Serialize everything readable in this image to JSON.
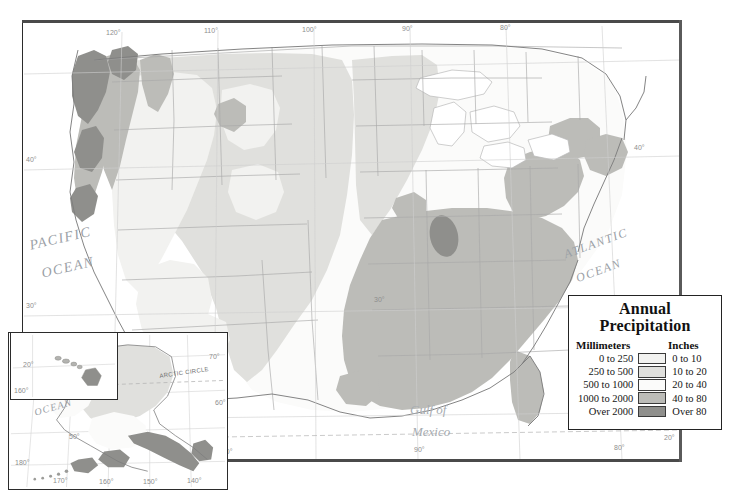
{
  "map": {
    "title": "Annual Precipitation",
    "title_line1": "Annual",
    "title_line2": "Precipitation",
    "ocean_labels": {
      "pacific_line1": "PACIFIC",
      "pacific_line2": "OCEAN",
      "atlantic_line1": "ATLANTIC",
      "atlantic_line2": "OCEAN",
      "gulf_line1": "Gulf of",
      "gulf_line2": "Mexico",
      "inset_pacific_line1": "PACIFIC",
      "inset_pacific_line2": "OCEAN"
    },
    "reference_lines": {
      "tropic_of_cancer": "TROPIC OF CANCER",
      "arctic_circle": "ARCTIC CIRCLE"
    },
    "graticule_top": [
      "120°",
      "110°",
      "100°",
      "90°",
      "80°"
    ],
    "graticule_bottom": [
      "100°",
      "90°",
      "80°",
      "20°"
    ],
    "graticule_left": [
      "40°",
      "30°"
    ],
    "graticule_right": [
      "40°",
      "30°"
    ],
    "alaska_inset": {
      "graticule_bottom": [
        "180°",
        "170°",
        "160°",
        "150°",
        "140°"
      ],
      "graticule_right": [
        "70°",
        "60°",
        "50°"
      ]
    },
    "hawaii_inset": {
      "graticule_left": [
        "20°"
      ],
      "graticule_bottom": [
        "160°"
      ]
    }
  },
  "legend": {
    "title_line1": "Annual",
    "title_line2": "Precipitation",
    "header_millimeters": "Millimeters",
    "header_inches": "Inches",
    "classes": [
      {
        "millimeters": "0 to 250",
        "inches": "0 to 10",
        "color": "#f2f2f0"
      },
      {
        "millimeters": "250 to 500",
        "inches": "10 to 20",
        "color": "#e0e0dd"
      },
      {
        "millimeters": "500 to 1000",
        "inches": "20 to 40",
        "color": "#fbfbfa"
      },
      {
        "millimeters": "1000 to 2000",
        "inches": "40 to 80",
        "color": "#bcbcb8"
      },
      {
        "millimeters": "Over 2000",
        "inches": "Over 80",
        "color": "#8f8f8c"
      }
    ]
  },
  "chart_data": {
    "type": "map",
    "title": "Annual Precipitation",
    "classes": [
      {
        "label_mm": "0 to 250",
        "label_in": "0 to 10",
        "min_mm": 0,
        "max_mm": 250,
        "color": "#f2f2f0"
      },
      {
        "label_mm": "250 to 500",
        "label_in": "10 to 20",
        "min_mm": 250,
        "max_mm": 500,
        "color": "#e0e0dd"
      },
      {
        "label_mm": "500 to 1000",
        "label_in": "20 to 40",
        "min_mm": 500,
        "max_mm": 1000,
        "color": "#fbfbfa"
      },
      {
        "label_mm": "1000 to 2000",
        "label_in": "40 to 80",
        "min_mm": 1000,
        "max_mm": 2000,
        "color": "#bcbcb8"
      },
      {
        "label_mm": "Over 2000",
        "label_in": "Over 80",
        "min_mm": 2000,
        "max_mm": null,
        "color": "#8f8f8c"
      }
    ],
    "regions": [
      {
        "name": "Pacific Northwest coast",
        "class": "Over 2000"
      },
      {
        "name": "Olympic Peninsula",
        "class": "Over 2000"
      },
      {
        "name": "Northern California coast",
        "class": "Over 2000"
      },
      {
        "name": "Cascade Range",
        "class": "1000 to 2000"
      },
      {
        "name": "Great Basin",
        "class": "0 to 250"
      },
      {
        "name": "Desert Southwest",
        "class": "0 to 250"
      },
      {
        "name": "Great Plains",
        "class": "250 to 500"
      },
      {
        "name": "Midwest",
        "class": "500 to 1000"
      },
      {
        "name": "Southeast",
        "class": "1000 to 2000"
      },
      {
        "name": "Gulf Coast",
        "class": "1000 to 2000"
      },
      {
        "name": "Southern Appalachians",
        "class": "Over 2000"
      },
      {
        "name": "Northeast",
        "class": "1000 to 2000"
      },
      {
        "name": "Southeast Alaska",
        "class": "Over 2000"
      },
      {
        "name": "Interior Alaska",
        "class": "250 to 500"
      }
    ]
  }
}
